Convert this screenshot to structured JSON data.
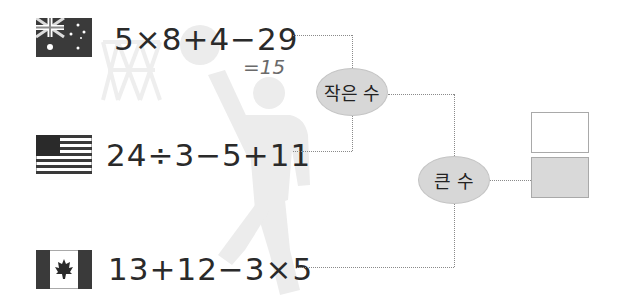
{
  "problems": [
    {
      "country": "Australia",
      "flag_icon": "australia-flag-icon",
      "expression": "5×8+4−29",
      "note": "=15"
    },
    {
      "country": "United States",
      "flag_icon": "usa-flag-icon",
      "expression": "24÷3−5+11"
    },
    {
      "country": "Canada",
      "flag_icon": "canada-flag-icon",
      "expression": "13+12−3×5"
    }
  ],
  "bracket": {
    "round1_label": "작은 수",
    "round2_label": "큰 수"
  },
  "answers": {
    "top_box": "",
    "bottom_box": ""
  },
  "colors": {
    "ellipse_fill": "#d7d7d7",
    "answer_box_filled": "#d9d9d9",
    "connector": "#8a8a8a",
    "silhouette": "#ececec"
  }
}
